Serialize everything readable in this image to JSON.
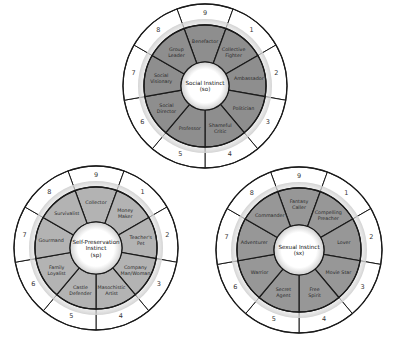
{
  "wheels": [
    {
      "id": "social",
      "center_label": [
        "Social Instinct",
        "(so)"
      ],
      "ring_color": "#8e8e8e",
      "numbers": [
        "9",
        "1",
        "2",
        "3",
        "4",
        "5",
        "6",
        "7",
        "8"
      ],
      "subtypes": [
        [
          "Benefactor"
        ],
        [
          "Collective",
          "Fighter"
        ],
        [
          "Ambassador"
        ],
        [
          "Politician"
        ],
        [
          "Shameful",
          "Critic"
        ],
        [
          "Professor"
        ],
        [
          "Social",
          "Director"
        ],
        [
          "Social",
          "Visionary"
        ],
        [
          "Group",
          "Leader"
        ]
      ]
    },
    {
      "id": "self-preservation",
      "center_label": [
        "Self-Preservation",
        "Instinct",
        "(sp)"
      ],
      "ring_color": "#b3b3b3",
      "numbers": [
        "9",
        "1",
        "2",
        "3",
        "4",
        "5",
        "6",
        "7",
        "8"
      ],
      "subtypes": [
        [
          "Collector"
        ],
        [
          "Money",
          "Maker"
        ],
        [
          "Teacher's",
          "Pet"
        ],
        [
          "Company",
          "Man/Woman"
        ],
        [
          "Masochistic",
          "Artist"
        ],
        [
          "Castle",
          "Defender"
        ],
        [
          "Family",
          "Loyalist"
        ],
        [
          "Gourmand"
        ],
        [
          "Survivalist"
        ]
      ]
    },
    {
      "id": "sexual",
      "center_label": [
        "Sexual Instinct",
        "(sx)"
      ],
      "ring_color": "#979797",
      "numbers": [
        "9",
        "1",
        "2",
        "3",
        "4",
        "5",
        "6",
        "7",
        "8"
      ],
      "subtypes": [
        [
          "Fantasy",
          "Caller"
        ],
        [
          "Compelling",
          "Preacher"
        ],
        [
          "Lover"
        ],
        [
          "Movie Star"
        ],
        [
          "Free",
          "Spirit"
        ],
        [
          "Secret",
          "Agent"
        ],
        [
          "Warrior"
        ],
        [
          "Adventurer"
        ],
        [
          "Commander"
        ]
      ]
    }
  ]
}
